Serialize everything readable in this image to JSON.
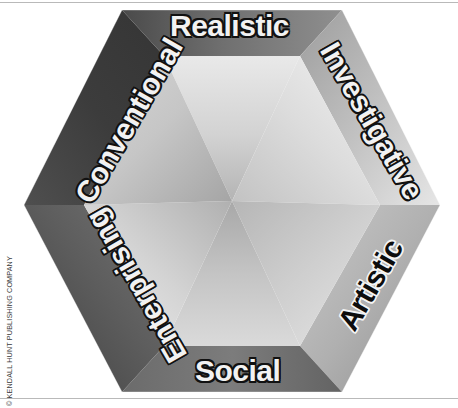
{
  "figure": {
    "shape": "hexagon",
    "credit": "© KENDALL HUNT PUBLISHING COMPANY"
  },
  "labels": {
    "realistic": "Realistic",
    "investigative": "Investigative",
    "artistic": "Artistic",
    "social": "Social",
    "enterprising": "Enterprising",
    "conventional": "Conventional"
  },
  "colors": {
    "page_background": "#ffffff",
    "rule": "#b9b9b9",
    "credit_text": "#3a3a3a",
    "bevel_darkest": "#3a3a3a",
    "bevel_dark": "#595959",
    "bevel_mid": "#8c8c8c",
    "bevel_light": "#c9c9c9",
    "bevel_lightest": "#eeeeee",
    "facet_dark": "#9a9a9a",
    "facet_mid": "#bdbdbd",
    "facet_light": "#e4e4e4",
    "facet_lightest": "#f3f3f3",
    "label_light": "#f2f2f2",
    "label_dark": "#0d0d0d"
  },
  "geometry": {
    "vertices": [
      {
        "name": "top-left",
        "x": 122,
        "y": 10
      },
      {
        "name": "top-right",
        "x": 342,
        "y": 10
      },
      {
        "name": "right",
        "x": 440,
        "y": 205
      },
      {
        "name": "bottom-right",
        "x": 342,
        "y": 392
      },
      {
        "name": "bottom-left",
        "x": 122,
        "y": 392
      },
      {
        "name": "left",
        "x": 24,
        "y": 205
      }
    ],
    "center": {
      "x": 232,
      "y": 201
    },
    "facet_count": 6
  }
}
